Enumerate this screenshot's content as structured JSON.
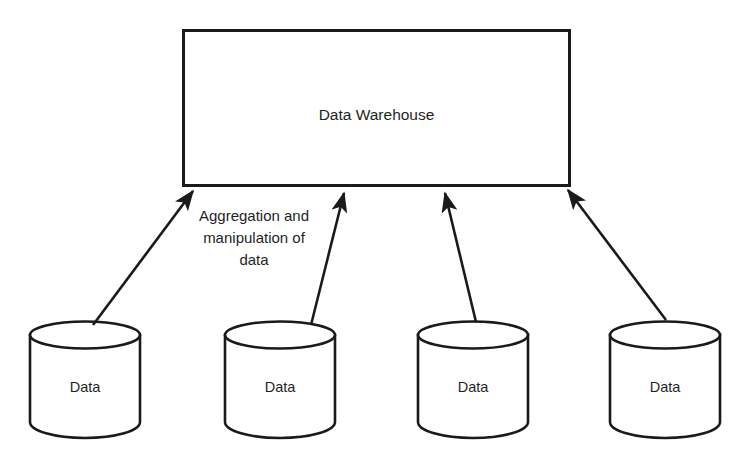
{
  "diagram": {
    "title": "Data Warehouse",
    "warehouse": {
      "label": "Data Warehouse",
      "shape": "rectangle",
      "x": 183,
      "y": 30,
      "width": 387,
      "height": 156
    },
    "flow_caption": {
      "lines": [
        "Aggregation and",
        "manipulation of",
        "data"
      ],
      "text": "Aggregation and manipulation of data"
    },
    "sources": [
      {
        "label": "Data",
        "shape": "cylinder",
        "x": 30,
        "y": 322,
        "width": 110,
        "height": 113
      },
      {
        "label": "Data",
        "shape": "cylinder",
        "x": 225,
        "y": 322,
        "width": 110,
        "height": 113
      },
      {
        "label": "Data",
        "shape": "cylinder",
        "x": 418,
        "y": 322,
        "width": 110,
        "height": 113
      },
      {
        "label": "Data",
        "shape": "cylinder",
        "x": 610,
        "y": 322,
        "width": 110,
        "height": 113
      }
    ],
    "arrows": [
      {
        "name": "arrow-source-1-to-warehouse",
        "from": [
          93,
          325
        ],
        "to": [
          191,
          188
        ]
      },
      {
        "name": "arrow-source-2-to-warehouse",
        "from": [
          311,
          325
        ],
        "to": [
          343,
          190
        ]
      },
      {
        "name": "arrow-source-3-to-warehouse",
        "from": [
          476,
          322
        ],
        "to": [
          444,
          190
        ]
      },
      {
        "name": "arrow-source-4-to-warehouse",
        "from": [
          666,
          320
        ],
        "to": [
          566,
          187
        ]
      }
    ],
    "colors": {
      "background": "#ffffff",
      "stroke": "#1a1a1a",
      "text": "#1f1f1f",
      "fill": "#ffffff"
    }
  }
}
